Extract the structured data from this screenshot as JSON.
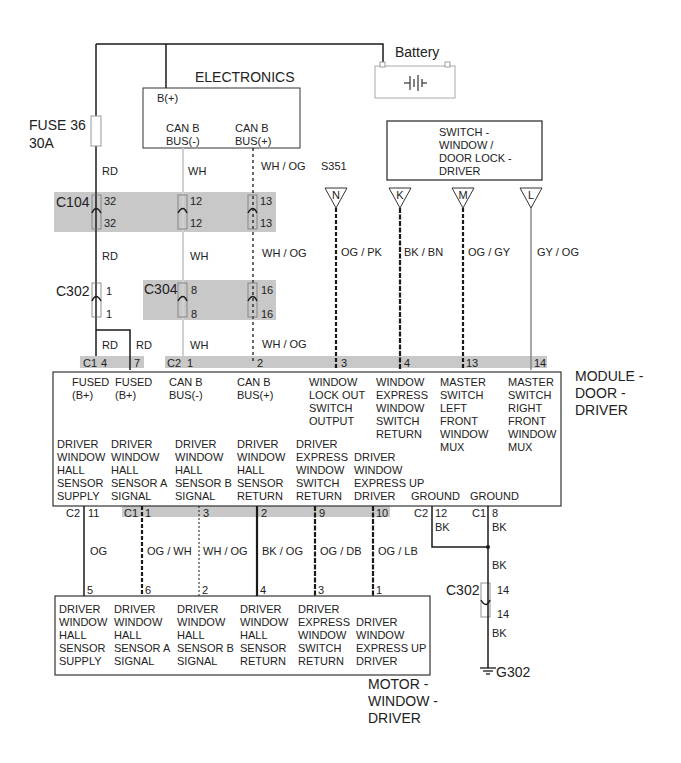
{
  "battery": {
    "label": "Battery",
    "plus": "+",
    "minus": "-"
  },
  "fuse": {
    "name": "FUSE 36",
    "rating": "30A",
    "wire": "RD"
  },
  "electronics": {
    "title": "ELECTRONICS",
    "pin_bplus": "B(+)",
    "can_minus": "CAN B\nBUS(-)",
    "can_plus": "CAN B\nBUS(+)"
  },
  "switch_module": {
    "title": "SWITCH -\nWINDOW /\nDOOR LOCK -\nDRIVER",
    "splice": "S351",
    "pins": [
      "N",
      "K",
      "M",
      "L"
    ]
  },
  "connectors": {
    "c104": {
      "name": "C104",
      "pins": [
        [
          "32",
          "32"
        ],
        [
          "12",
          "12"
        ],
        [
          "13",
          "13"
        ]
      ]
    },
    "c302_top": {
      "name": "C302",
      "pins": [
        "1",
        "1"
      ]
    },
    "c304": {
      "name": "C304",
      "pins": [
        [
          "8",
          "8"
        ],
        [
          "16",
          "16"
        ]
      ]
    },
    "c302_bottom": {
      "name": "C302",
      "pins": [
        "14",
        "14"
      ]
    }
  },
  "wires_top": {
    "rd1": "RD",
    "wh1": "WH",
    "whog1": "WH / OG",
    "rd2": "RD",
    "wh2": "WH",
    "whog2": "WH / OG",
    "rd3": "RD",
    "rd4": "RD",
    "wh3": "WH",
    "whog3": "WH / OG",
    "ogpk": "OG / PK",
    "bkbn": "BK / BN",
    "oggy": "OG / GY",
    "gyog": "GY / OG"
  },
  "module_top_pins": {
    "c1": "C1",
    "c1_pins": [
      "4",
      "7"
    ],
    "c2": "C2",
    "c2_pins": [
      "1",
      "2",
      "3",
      "4",
      "13",
      "14"
    ]
  },
  "module": {
    "title": "MODULE -\nDOOR -\nDRIVER",
    "top_labels": [
      "FUSED\n(B+)",
      "FUSED\n(B+)",
      "CAN B\nBUS(-)",
      "CAN B\nBUS(+)",
      "WINDOW\nLOCK OUT\nSWITCH\nOUTPUT",
      "WINDOW\nEXPRESS\nWINDOW\nSWITCH\nRETURN",
      "MASTER\nSWITCH\nLEFT\nFRONT\nWINDOW\nMUX",
      "MASTER\nSWITCH\nRIGHT\nFRONT\nWINDOW\nMUX"
    ],
    "bottom_labels": [
      "DRIVER\nWINDOW\nHALL\nSENSOR\nSUPPLY",
      "DRIVER\nWINDOW\nHALL\nSENSOR A\nSIGNAL",
      "DRIVER\nWINDOW\nHALL\nSENSOR B\nSIGNAL",
      "DRIVER\nWINDOW\nHALL\nSENSOR\nRETURN",
      "DRIVER\nEXPRESS\nWINDOW\nSWITCH\nRETURN",
      "DRIVER\nWINDOW\nEXPRESS UP\nDRIVER",
      "GROUND",
      "GROUND"
    ]
  },
  "module_bottom_pins": {
    "c2a": "C2",
    "c2a_pin": "11",
    "c1": "C1",
    "c1_pins": [
      "1",
      "3",
      "2",
      "9",
      "10"
    ],
    "c2b": "C2",
    "c2b_pin": "12",
    "c1b": "C1",
    "c1b_pin": "8"
  },
  "wires_bottom": {
    "og": "OG",
    "ogwh": "OG / WH",
    "whog": "WH / OG",
    "bkog": "BK / OG",
    "ogdb": "OG / DB",
    "oglb": "OG / LB",
    "bk1": "BK",
    "bk2": "BK",
    "bk3": "BK",
    "bk4": "BK"
  },
  "motor_pins": [
    "5",
    "6",
    "2",
    "4",
    "3",
    "1"
  ],
  "motor": {
    "title": "MOTOR -\nWINDOW -\nDRIVER",
    "labels": [
      "DRIVER\nWINDOW\nHALL\nSENSOR\nSUPPLY",
      "DRIVER\nWINDOW\nHALL\nSENSOR A\nSIGNAL",
      "DRIVER\nWINDOW\nHALL\nSENSOR B\nSIGNAL",
      "DRIVER\nWINDOW\nHALL\nSENSOR\nRETURN",
      "DRIVER\nEXPRESS\nWINDOW\nSWITCH\nRETURN",
      "DRIVER\nWINDOW\nEXPRESS UP\nDRIVER"
    ]
  },
  "ground": {
    "name": "G302"
  },
  "colors": {
    "wire": "#1a1a1a",
    "connector_band": "#c8c8c8",
    "white_wire": "#bdbdbd",
    "gray_wire": "#8a8a8a"
  }
}
